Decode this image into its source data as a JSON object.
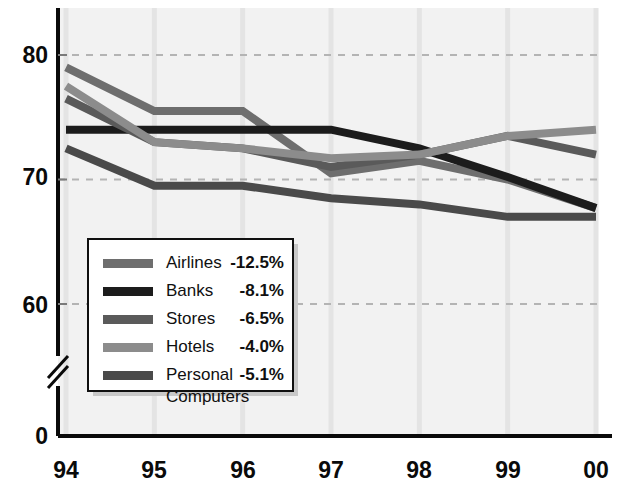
{
  "chart_data": {
    "type": "line",
    "title": "",
    "subtitle": "",
    "xlabel": "",
    "ylabel": "",
    "x": [
      "94",
      "95",
      "96",
      "97",
      "98",
      "99",
      "00"
    ],
    "xtick_labels": [
      "94",
      "95",
      "96",
      "97",
      "98",
      "99",
      "00"
    ],
    "ytick_labels": [
      "80",
      "70",
      "60",
      "0"
    ],
    "ytick_values": [
      80,
      70,
      60,
      0
    ],
    "ylim": [
      58.5,
      82.5
    ],
    "axis_break": true,
    "axis_break_note": "zig-zag break between 60 and 0 on y-axis",
    "grid": "horizontal dashed gridlines at 80, 70 and 60; faint vertical gridlines at each year",
    "legend_position": "inside lower-left of plot area",
    "series": [
      {
        "name": "Airlines",
        "change_label": "-12.5%",
        "color": "#6e6e6e",
        "values": [
          79.0,
          75.5,
          75.5,
          70.5,
          71.5,
          70.0,
          67.7
        ]
      },
      {
        "name": "Banks",
        "change_label": "-8.1%",
        "color": "#1c1c1c",
        "values": [
          74.0,
          74.0,
          74.0,
          74.0,
          72.5,
          70.2,
          67.7
        ]
      },
      {
        "name": "Stores",
        "change_label": "-6.5%",
        "color": "#5a5a5a",
        "values": [
          76.5,
          73.0,
          72.5,
          71.0,
          72.0,
          73.5,
          72.0
        ]
      },
      {
        "name": "Hotels",
        "change_label": "-4.0%",
        "color": "#8c8c8c",
        "values": [
          77.5,
          73.0,
          72.5,
          71.7,
          72.0,
          73.5,
          74.0
        ]
      },
      {
        "name": "Personal Computers",
        "change_label": "-5.1%",
        "color": "#4a4a4a",
        "values": [
          72.5,
          69.5,
          69.5,
          68.5,
          68.0,
          67.0,
          67.0
        ]
      }
    ]
  },
  "legend": {
    "rows": [
      {
        "label": "Airlines",
        "value": "-12.5%",
        "swatch": "#6e6e6e"
      },
      {
        "label": "Banks",
        "value": "-8.1%",
        "swatch": "#1c1c1c"
      },
      {
        "label": "Stores",
        "value": "-6.5%",
        "swatch": "#5a5a5a"
      },
      {
        "label": "Hotels",
        "value": "-4.0%",
        "swatch": "#8c8c8c"
      },
      {
        "label": "Personal",
        "label_line2": "Computers",
        "value": "-5.1%",
        "swatch": "#4a4a4a"
      }
    ]
  },
  "axes": {
    "y_labels": [
      "80",
      "70",
      "60",
      "0"
    ],
    "x_labels": [
      "94",
      "95",
      "96",
      "97",
      "98",
      "99",
      "00"
    ]
  },
  "colors": {
    "plot_background": "#f2f2f2",
    "page_background": "#ffffff",
    "axis": "#0a0a0a",
    "gridline": "#b4b4b4",
    "legend_background": "#ffffff",
    "legend_border": "#101010",
    "legend_shadow": "#c8c8c8"
  }
}
